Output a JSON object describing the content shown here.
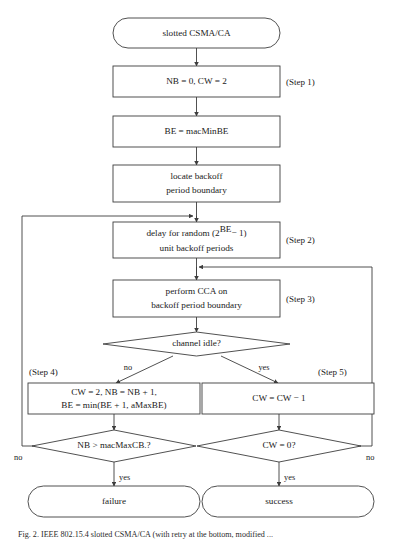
{
  "figure": {
    "caption": "Fig. 2. IEEE 802.15.4 slotted CSMA/CA (with retry at the bottom, modified ...",
    "line_color": "#3d3d3d",
    "background_color": "#ffffff",
    "text_color": "#1a1a1a"
  },
  "nodes": {
    "start": {
      "label": "slotted CSMA/CA",
      "shape": "terminal"
    },
    "init": {
      "label": "NB = 0, CW = 2",
      "shape": "process"
    },
    "be_init": {
      "label": "BE = macMinBE",
      "shape": "process"
    },
    "locate": {
      "line1": "locate backoff",
      "line2": "period boundary",
      "shape": "process"
    },
    "delay": {
      "line1_a": "delay for random (2",
      "line1_sup": "BE",
      "line1_b": "− 1)",
      "line2": "unit backoff periods",
      "shape": "process"
    },
    "cca": {
      "line1": "perform CCA on",
      "line2": "backoff period boundary",
      "shape": "process"
    },
    "channel_idle": {
      "label": "channel idle?",
      "shape": "decision"
    },
    "busy_update": {
      "line1": "CW = 2, NB = NB + 1,",
      "line2": "BE = min(BE + 1, aMaxBE)",
      "shape": "process"
    },
    "cw_dec": {
      "label": "CW = CW − 1",
      "shape": "process"
    },
    "nb_check": {
      "label": "NB > macMaxCB.?",
      "shape": "decision"
    },
    "cw_check": {
      "label": "CW = 0?",
      "shape": "decision"
    },
    "failure": {
      "label": "failure",
      "shape": "terminal"
    },
    "success": {
      "label": "success",
      "shape": "terminal"
    }
  },
  "step_labels": {
    "step1": "(Step 1)",
    "step2": "(Step 2)",
    "step3": "(Step 3)",
    "step4": "(Step 4)",
    "step5": "(Step 5)"
  },
  "edge_labels": {
    "channel_no": "no",
    "channel_yes": "yes",
    "nb_no": "no",
    "nb_yes": "yes",
    "cw_no": "no",
    "cw_yes": "yes"
  }
}
